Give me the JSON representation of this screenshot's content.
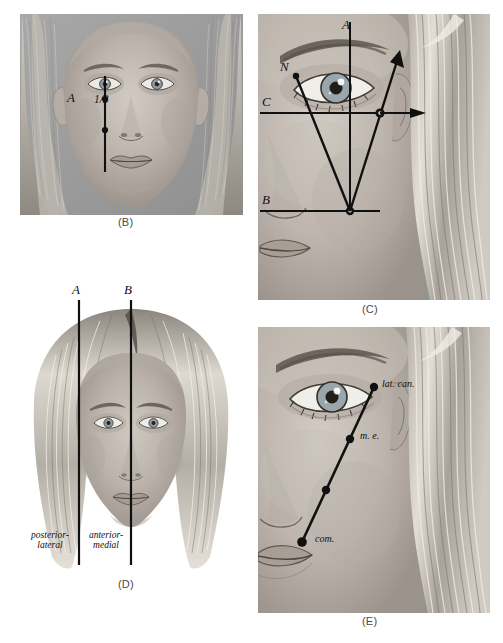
{
  "figure": {
    "background_color": "#ffffff",
    "ink_color": "#111111",
    "art_tone": "grayscale-pencil-portrait",
    "panels": [
      {
        "id": "B",
        "caption": "(B)",
        "subject": "frontal-female-face",
        "description": "Frontal view of a face with a vertical reference line dropped from the pupil, marked with points.",
        "annotations": [
          {
            "name": "point-label-A",
            "text": "A"
          },
          {
            "name": "fraction-label",
            "text": "1/3"
          }
        ]
      },
      {
        "id": "C",
        "caption": "(C)",
        "subject": "three-quarter-female-face",
        "description": "Three-quarter face with axis A vertical, axis C horizontal through the canthus, axis B horizontal low, and vectors radiating from a lower vertex.",
        "annotations": [
          {
            "name": "axis-label-A",
            "text": "A"
          },
          {
            "name": "axis-label-B",
            "text": "B"
          },
          {
            "name": "axis-label-C",
            "text": "C"
          },
          {
            "name": "point-label-N",
            "text": "N"
          },
          {
            "name": "point-label-O",
            "text": "0"
          }
        ]
      },
      {
        "id": "D",
        "caption": "(D)",
        "subject": "frontal-female-face-with-hair",
        "description": "Frontal view with two vertical planes A and B dividing posterior-lateral from anterior-medial regions.",
        "annotations": [
          {
            "name": "plane-label-A",
            "text": "A"
          },
          {
            "name": "plane-label-B",
            "text": "B"
          },
          {
            "name": "region-label-posterior",
            "line1": "posterior-",
            "line2": "lateral"
          },
          {
            "name": "region-label-anterior",
            "line1": "anterior-",
            "line2": "medial"
          }
        ]
      },
      {
        "id": "E",
        "caption": "(E)",
        "subject": "three-quarter-female-face",
        "description": "Three-quarter face with an oblique line bearing four landmark points running from the lateral canthus down to the commissure.",
        "annotations": [
          {
            "name": "landmark-label-lateral-canthus",
            "text": "lat. can."
          },
          {
            "name": "landmark-label-mid-eye",
            "text": "m. e."
          },
          {
            "name": "landmark-label-commissure",
            "text": "com."
          }
        ]
      }
    ]
  }
}
